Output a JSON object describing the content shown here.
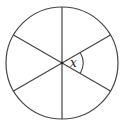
{
  "diagram": {
    "type": "circle-divided-by-diameters",
    "sectors": 6,
    "diameters": 3,
    "angle_label": "x",
    "stroke_color": "#444444",
    "background": "#ffffff"
  }
}
